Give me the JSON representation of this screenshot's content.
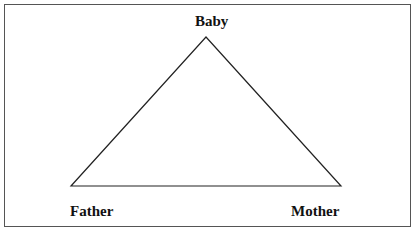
{
  "diagram": {
    "type": "triangle",
    "nodes": {
      "top": "Baby",
      "bottom_left": "Father",
      "bottom_right": "Mother"
    },
    "line_color": "#222222"
  }
}
